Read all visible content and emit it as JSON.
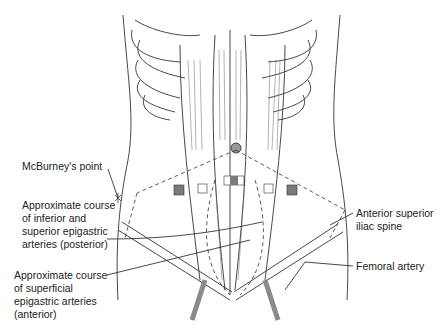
{
  "diagram": {
    "labels": {
      "mcburney": "McBurney's point",
      "inferior_superior_l1": "Approximate course",
      "inferior_superior_l2": "of inferior and",
      "inferior_superior_l3": "superior epigastric",
      "inferior_superior_l4": "arteries (posterior)",
      "superficial_l1": "Approximate course",
      "superficial_l2": "of superficial",
      "superficial_l3": "epigastric arteries",
      "superficial_l4": "(anterior)",
      "asis_l1": "Anterior superior",
      "asis_l2": "iliac spine",
      "femoral": "Femoral artery"
    },
    "colors": {
      "line": "#333333",
      "port_filled": "#7a7a7a",
      "artery": "#8a8a8a"
    }
  }
}
